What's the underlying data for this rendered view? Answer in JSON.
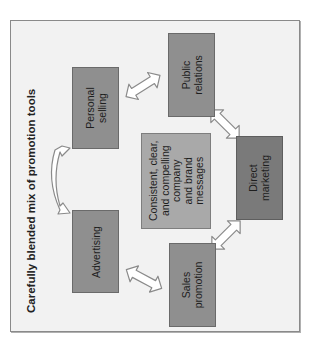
{
  "diagram": {
    "title": "Carefully blended mix of promotion tools",
    "center": {
      "label": "Consistent, clear,\nand compelling\ncompany\nand brand\nmessages"
    },
    "nodes": [
      {
        "id": "personal-selling",
        "label": "Personal\nselling"
      },
      {
        "id": "public-relations",
        "label": "Public\nrelations"
      },
      {
        "id": "direct-marketing",
        "label": "Direct\nmarketing"
      },
      {
        "id": "sales-promotion",
        "label": "Sales\npromotion"
      },
      {
        "id": "advertising",
        "label": "Advertising"
      }
    ],
    "connections": [
      {
        "from": "advertising",
        "to": "personal-selling",
        "type": "curved-double-arrow"
      },
      {
        "from": "personal-selling",
        "to": "public-relations",
        "type": "double-arrow"
      },
      {
        "from": "public-relations",
        "to": "direct-marketing",
        "type": "double-arrow"
      },
      {
        "from": "direct-marketing",
        "to": "sales-promotion",
        "type": "double-arrow"
      },
      {
        "from": "sales-promotion",
        "to": "advertising",
        "type": "double-arrow"
      }
    ],
    "colors": {
      "frame_bg": "#f2f2f2",
      "box_fill": "#8f8f8f",
      "center_fill": "#a9a9a9",
      "direct_fill": "#7a7a7a",
      "arrow_fill": "#ffffff",
      "arrow_stroke": "#8a8a8a"
    }
  }
}
